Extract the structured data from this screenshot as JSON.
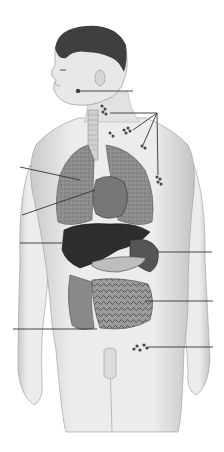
{
  "diagram": {
    "style": "grayscale anatomical illustration",
    "labels_visible": false,
    "leader_lines": [
      {
        "id": "submandibular-node",
        "x1": 78,
        "y1": 91,
        "x2": 133,
        "y2": 91
      },
      {
        "id": "cervical-nodes",
        "x1": 110,
        "y1": 113,
        "x2": 157,
        "y2": 113
      },
      {
        "id": "axillary-nodes",
        "x1": 157,
        "y1": 113,
        "x2": 133,
        "y2": 130
      },
      {
        "id": "axillary-nodes-2",
        "x1": 157,
        "y1": 113,
        "x2": 143,
        "y2": 145
      },
      {
        "id": "axillary-nodes-3",
        "x1": 157,
        "y1": 113,
        "x2": 158,
        "y2": 175
      },
      {
        "id": "lungs",
        "x1": 20,
        "y1": 167,
        "x2": 80,
        "y2": 180
      },
      {
        "id": "heart",
        "x1": 22,
        "y1": 215,
        "x2": 95,
        "y2": 190
      },
      {
        "id": "liver",
        "x1": 20,
        "y1": 243,
        "x2": 62,
        "y2": 243
      },
      {
        "id": "spleen",
        "x1": 158,
        "y1": 252,
        "x2": 212,
        "y2": 252
      },
      {
        "id": "intestines",
        "x1": 145,
        "y1": 301,
        "x2": 213,
        "y2": 301
      },
      {
        "id": "large-intestine",
        "x1": 13,
        "y1": 329,
        "x2": 97,
        "y2": 329
      },
      {
        "id": "inguinal-nodes",
        "x1": 148,
        "y1": 347,
        "x2": 213,
        "y2": 347
      }
    ],
    "colors": {
      "background": "#ffffff",
      "skin": "#e6e6e6",
      "skin_shadow": "#bdbdbd",
      "hair": "#3a3a3a",
      "lung": "#8a8a8a",
      "liver": "#2e2e2e",
      "organ_mid": "#6a6a6a",
      "line": "#333333"
    }
  }
}
